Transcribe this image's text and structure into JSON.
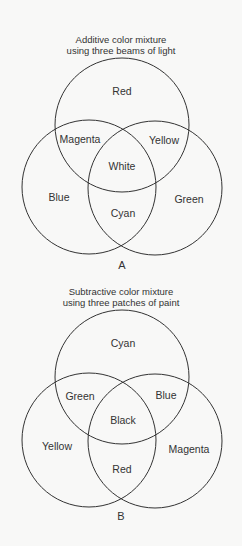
{
  "diagrams": [
    {
      "id": "A",
      "caption": "A",
      "title_line1": "Additive color mixture",
      "title_line2": "using three beams of light",
      "circles": [
        {
          "name": "top",
          "cx": 122,
          "cy": 125,
          "r": 67
        },
        {
          "name": "left",
          "cx": 88,
          "cy": 186,
          "r": 67
        },
        {
          "name": "right",
          "cx": 155,
          "cy": 186,
          "r": 67
        }
      ],
      "regions": {
        "top": "Red",
        "top_left": "Magenta",
        "top_right": "Yellow",
        "center": "White",
        "left": "Blue",
        "right": "Green",
        "bottom": "Cyan"
      }
    },
    {
      "id": "B",
      "caption": "B",
      "title_line1": "Subtractive color mixture",
      "title_line2": "using three patches of paint",
      "circles": [
        {
          "name": "top",
          "cx": 122,
          "cy": 377,
          "r": 67
        },
        {
          "name": "left",
          "cx": 88,
          "cy": 440,
          "r": 67
        },
        {
          "name": "right",
          "cx": 155,
          "cy": 440,
          "r": 67
        }
      ],
      "regions": {
        "top": "Cyan",
        "top_left": "Green",
        "top_right": "Blue",
        "center": "Black",
        "left": "Yellow",
        "right": "Magenta",
        "bottom": "Red"
      }
    }
  ],
  "colors": {
    "line": "#333333",
    "background": "#f8f8f7"
  }
}
